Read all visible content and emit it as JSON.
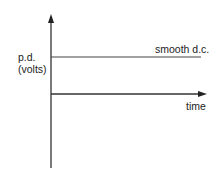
{
  "diagram": {
    "type": "graph-sketch",
    "y_axis_label_line1": "p.d.",
    "y_axis_label_line2": "(volts)",
    "x_axis_label": "time",
    "series_label": "smooth d.c.",
    "colors": {
      "axis": "#333333",
      "line": "#444444",
      "text": "#222222"
    }
  }
}
